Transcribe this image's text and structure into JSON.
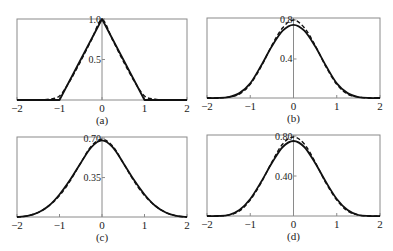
{
  "chart_data": [
    {
      "panel": "a",
      "type": "line",
      "caption": "(a)",
      "xlim": [
        -2,
        2
      ],
      "xticks": [
        "-2",
        "-1",
        "0",
        "1",
        "2"
      ],
      "ylim": [
        0,
        1.0
      ],
      "yticks": [
        {
          "value": 1.0,
          "label": "1.0"
        },
        {
          "value": 0.5,
          "label": "0.5"
        }
      ],
      "grid": false,
      "series": [
        {
          "name": "solid",
          "style": "solid",
          "x": [
            -2,
            -1,
            0,
            1,
            2
          ],
          "y": [
            0,
            0,
            1.0,
            0,
            0
          ]
        },
        {
          "name": "dashed",
          "style": "dashed",
          "x": [
            -1.5,
            -1.25,
            -1.0,
            -0.75,
            -0.5,
            -0.25,
            0,
            0.25,
            0.5,
            0.75,
            1.0,
            1.25,
            1.5
          ],
          "y": [
            0.0,
            0.01,
            0.05,
            0.24,
            0.48,
            0.74,
            0.99,
            0.74,
            0.48,
            0.24,
            0.05,
            0.01,
            0.0
          ]
        }
      ]
    },
    {
      "panel": "b",
      "type": "line",
      "caption": "(b)",
      "xlim": [
        -2,
        2
      ],
      "xticks": [
        "-2",
        "-1",
        "0",
        "1",
        "2"
      ],
      "ylim": [
        0,
        0.82
      ],
      "yticks": [
        {
          "value": 0.8,
          "label": "0.8"
        },
        {
          "value": 0.4,
          "label": "0.4"
        }
      ],
      "grid": false,
      "series": [
        {
          "name": "solid",
          "style": "solid",
          "x": [
            -2,
            -1.75,
            -1.5,
            -1.25,
            -1.0,
            -0.75,
            -0.5,
            -0.25,
            0,
            0.25,
            0.5,
            0.75,
            1.0,
            1.25,
            1.5,
            1.75,
            2
          ],
          "y": [
            0.0,
            0.0,
            0.01,
            0.05,
            0.15,
            0.33,
            0.53,
            0.69,
            0.75,
            0.69,
            0.53,
            0.33,
            0.15,
            0.05,
            0.01,
            0.0,
            0.0
          ]
        },
        {
          "name": "dashed",
          "style": "dashed",
          "x": [
            -2,
            -1.75,
            -1.5,
            -1.25,
            -1.0,
            -0.75,
            -0.5,
            -0.25,
            0,
            0.25,
            0.5,
            0.75,
            1.0,
            1.25,
            1.5,
            1.75,
            2
          ],
          "y": [
            0.0,
            0.0,
            0.01,
            0.04,
            0.14,
            0.32,
            0.54,
            0.72,
            0.8,
            0.72,
            0.54,
            0.32,
            0.14,
            0.04,
            0.01,
            0.0,
            0.0
          ]
        }
      ]
    },
    {
      "panel": "c",
      "type": "line",
      "caption": "(c)",
      "xlim": [
        -2,
        2
      ],
      "xticks": [
        "-2",
        "-1",
        "0",
        "1",
        "2"
      ],
      "ylim": [
        0,
        0.7
      ],
      "yticks": [
        {
          "value": 0.7,
          "label": "0.70"
        },
        {
          "value": 0.35,
          "label": "0.35"
        }
      ],
      "grid": false,
      "series": [
        {
          "name": "solid",
          "style": "solid",
          "x": [
            -2,
            -1.75,
            -1.5,
            -1.25,
            -1.0,
            -0.75,
            -0.5,
            -0.25,
            0,
            0.25,
            0.5,
            0.75,
            1.0,
            1.25,
            1.5,
            1.75,
            2
          ],
          "y": [
            0.0,
            0.01,
            0.04,
            0.1,
            0.2,
            0.33,
            0.48,
            0.62,
            0.68,
            0.62,
            0.48,
            0.33,
            0.2,
            0.1,
            0.04,
            0.01,
            0.0
          ]
        },
        {
          "name": "dashed",
          "style": "dashed",
          "x": [
            -2,
            -1.75,
            -1.5,
            -1.25,
            -1.0,
            -0.75,
            -0.5,
            -0.25,
            0,
            0.25,
            0.5,
            0.75,
            1.0,
            1.25,
            1.5,
            1.75,
            2
          ],
          "y": [
            0.0,
            0.01,
            0.04,
            0.1,
            0.19,
            0.32,
            0.48,
            0.63,
            0.69,
            0.63,
            0.48,
            0.32,
            0.19,
            0.1,
            0.04,
            0.01,
            0.0
          ]
        }
      ]
    },
    {
      "panel": "d",
      "type": "line",
      "caption": "(d)",
      "xlim": [
        -2,
        2
      ],
      "xticks": [
        "-2",
        "-1",
        "0",
        "1",
        "2"
      ],
      "ylim": [
        0,
        0.8
      ],
      "yticks": [
        {
          "value": 0.8,
          "label": "0.80"
        },
        {
          "value": 0.4,
          "label": "0.40"
        }
      ],
      "grid": false,
      "series": [
        {
          "name": "solid",
          "style": "solid",
          "x": [
            -2,
            -1.75,
            -1.5,
            -1.25,
            -1.0,
            -0.75,
            -0.5,
            -0.25,
            0,
            0.25,
            0.5,
            0.75,
            1.0,
            1.25,
            1.5,
            1.75,
            2
          ],
          "y": [
            0.0,
            0.0,
            0.01,
            0.06,
            0.17,
            0.34,
            0.53,
            0.69,
            0.75,
            0.69,
            0.53,
            0.34,
            0.17,
            0.06,
            0.01,
            0.0,
            0.0
          ]
        },
        {
          "name": "dashed",
          "style": "dashed",
          "x": [
            -2,
            -1.75,
            -1.5,
            -1.25,
            -1.0,
            -0.75,
            -0.5,
            -0.25,
            0,
            0.25,
            0.5,
            0.75,
            1.0,
            1.25,
            1.5,
            1.75,
            2
          ],
          "y": [
            0.0,
            0.0,
            0.01,
            0.05,
            0.16,
            0.33,
            0.54,
            0.72,
            0.79,
            0.72,
            0.54,
            0.33,
            0.16,
            0.05,
            0.01,
            0.0,
            0.0
          ]
        }
      ]
    }
  ],
  "layout": {
    "panels": [
      {
        "id": "a",
        "left": 17,
        "right": 187,
        "top": 19,
        "bottom": 100,
        "ytop_value": 1.0
      },
      {
        "id": "b",
        "left": 207,
        "right": 380,
        "top": 18,
        "bottom": 98,
        "ytop_value": 0.82
      },
      {
        "id": "c",
        "left": 17,
        "right": 187,
        "top": 137,
        "bottom": 217,
        "ytop_value": 0.71
      },
      {
        "id": "d",
        "left": 207,
        "right": 380,
        "top": 135,
        "bottom": 216,
        "ytop_value": 0.81
      }
    ]
  }
}
